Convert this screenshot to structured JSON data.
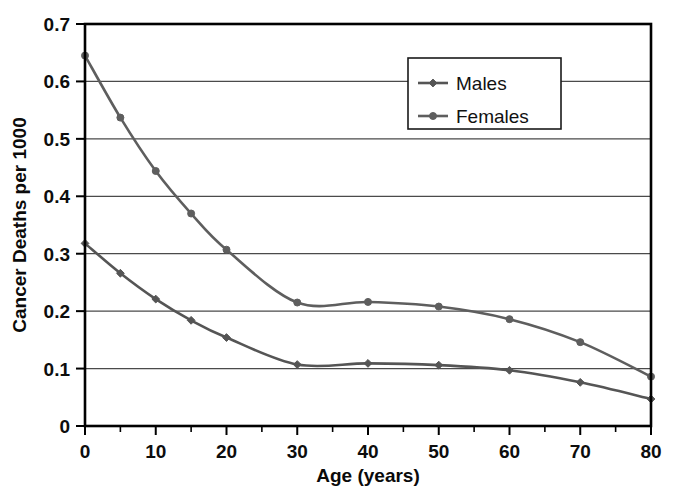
{
  "chart_data": {
    "type": "line",
    "title": "",
    "xlabel": "Age (years)",
    "ylabel": "Cancer Deaths per 1000",
    "xlim": [
      0,
      80
    ],
    "ylim": [
      0,
      0.7
    ],
    "xticks": [
      0,
      10,
      20,
      30,
      40,
      50,
      60,
      70,
      80
    ],
    "xtick_labels": [
      "0",
      "10",
      "20",
      "30",
      "40",
      "50",
      "60",
      "70",
      "80"
    ],
    "xticks_minor": [
      5,
      15,
      25,
      35,
      45,
      55,
      65,
      75
    ],
    "yticks": [
      0,
      0.1,
      0.2,
      0.3,
      0.4,
      0.5,
      0.6,
      0.7
    ],
    "ytick_labels": [
      "0",
      "0.1",
      "0.2",
      "0.3",
      "0.4",
      "0.5",
      "0.6",
      "0.7"
    ],
    "grid": "horizontal",
    "legend_position": "upper-right-inside",
    "x": [
      0,
      5,
      10,
      15,
      20,
      30,
      40,
      50,
      60,
      70,
      80
    ],
    "series": [
      {
        "name": "Males",
        "marker": "diamond",
        "color": "#555555",
        "values": [
          0.318,
          0.266,
          0.221,
          0.184,
          0.154,
          0.107,
          0.109,
          0.106,
          0.097,
          0.076,
          0.047
        ]
      },
      {
        "name": "Females",
        "marker": "circle",
        "color": "#5e5e5e",
        "values": [
          0.645,
          0.537,
          0.444,
          0.37,
          0.307,
          0.215,
          0.216,
          0.208,
          0.186,
          0.146,
          0.086
        ]
      }
    ]
  },
  "legend": {
    "entries": [
      {
        "label": "Males"
      },
      {
        "label": "Females"
      }
    ]
  },
  "colors": {
    "series_males": "#555555",
    "series_females": "#5e5e5e",
    "gridline": "#4a4a4a",
    "frame": "#000000",
    "background": "#ffffff",
    "text": "#0d0d0d"
  }
}
